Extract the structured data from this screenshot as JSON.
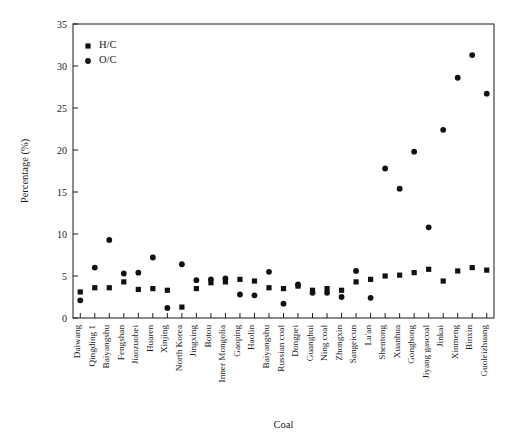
{
  "chart_data": {
    "type": "scatter",
    "title": "",
    "xlabel": "Coal",
    "ylabel": "Percentage (%)",
    "ylim": [
      0,
      35
    ],
    "yticks": [
      0,
      5,
      10,
      15,
      20,
      25,
      30,
      35
    ],
    "grid": false,
    "legend_position": "top-left",
    "categories": [
      "Daiwang",
      "Qingding 1",
      "Baiyangshu",
      "Fengshan",
      "Jiaozuobei",
      "Huaren",
      "Xinjing",
      "North Korea",
      "Jingxing",
      "Botou",
      "Inner Mongolia",
      "Gaoping",
      "Haolin",
      "Baiyangshu",
      "Russian coal",
      "Dongpei",
      "Guanghui",
      "Ning coal",
      "Zhongxin",
      "Sangeicun",
      "Lu'an",
      "Shentong",
      "Xuanhua",
      "Gonghong",
      "Jiyang gascoal",
      "Jinkai",
      "Xinmeng",
      "Binxin",
      "Guoleizhuang"
    ],
    "series": [
      {
        "name": "H/C",
        "marker": "square",
        "color": "#111111",
        "values": [
          3.1,
          3.6,
          3.6,
          4.3,
          3.4,
          3.5,
          3.3,
          1.3,
          3.5,
          4.2,
          4.3,
          4.6,
          4.4,
          3.6,
          3.5,
          3.8,
          3.3,
          3.5,
          3.3,
          4.3,
          4.6,
          5.0,
          5.1,
          5.4,
          5.8,
          4.4,
          5.6,
          6.0,
          5.7
        ]
      },
      {
        "name": "O/C",
        "marker": "circle",
        "color": "#111111",
        "values": [
          2.1,
          6.0,
          9.3,
          5.3,
          5.4,
          7.2,
          1.2,
          6.4,
          4.5,
          4.6,
          4.7,
          2.8,
          2.7,
          5.5,
          1.7,
          4.0,
          3.0,
          3.0,
          2.5,
          5.6,
          2.4,
          17.8,
          15.4,
          19.8,
          10.8,
          22.4,
          28.6,
          31.3,
          26.7
        ]
      }
    ],
    "legend": [
      {
        "label": "H/C",
        "marker": "square"
      },
      {
        "label": "O/C",
        "marker": "circle"
      }
    ]
  }
}
